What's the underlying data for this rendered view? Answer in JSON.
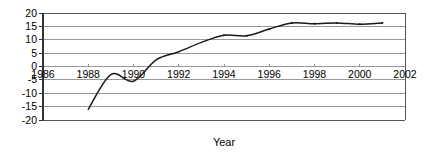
{
  "chart_data": {
    "type": "line",
    "title": "",
    "xlabel": "Year",
    "ylabel": "",
    "xlim": [
      1986,
      2002
    ],
    "ylim": [
      -20,
      20
    ],
    "grid": true,
    "legend": false,
    "x_ticks": [
      "1986",
      "1988",
      "1990",
      "1992",
      "1994",
      "1996",
      "1998",
      "2000",
      "2002"
    ],
    "x_tick_values": [
      1986,
      1988,
      1990,
      1992,
      1994,
      1996,
      1998,
      2000,
      2002
    ],
    "y_ticks": [
      "20",
      "15",
      "10",
      "5",
      "0",
      "-5",
      "-10",
      "-15",
      "-20"
    ],
    "y_tick_values": [
      20,
      15,
      10,
      5,
      0,
      -5,
      -10,
      -15,
      -20
    ],
    "series": [
      {
        "name": "series-1",
        "color": "#1a1a1a",
        "x": [
          1988,
          1989,
          1990,
          1991,
          1992,
          1993,
          1994,
          1995,
          1996,
          1997,
          1998,
          1999,
          2000,
          2001
        ],
        "values": [
          -16.0,
          -3.0,
          -5.5,
          2.5,
          5.5,
          9.0,
          11.7,
          11.5,
          14.0,
          16.3,
          16.0,
          16.3,
          15.8,
          16.3
        ]
      }
    ]
  },
  "axis": {
    "x_label": "Year"
  },
  "colors": {
    "line": "#1a1a1a",
    "grid": "#808080",
    "frame": "#555555",
    "background": "#ffffff",
    "text": "#000000"
  }
}
